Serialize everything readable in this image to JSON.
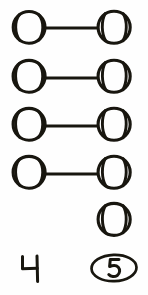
{
  "figure": {
    "title": "One-to-one matching of circles",
    "background_color": "#fefefe",
    "ink_color": "#18160f",
    "width": 148,
    "height": 295
  },
  "left_column": {
    "label": "left-group",
    "icon_name": "ball-circle",
    "count_value": "4",
    "count_circled": false,
    "items": [
      {
        "id": "L1",
        "cx": 29,
        "cy": 27,
        "r": 16
      },
      {
        "id": "L2",
        "cx": 29,
        "cy": 76,
        "r": 16
      },
      {
        "id": "L3",
        "cx": 29,
        "cy": 124,
        "r": 16
      },
      {
        "id": "L4",
        "cx": 29,
        "cy": 172,
        "r": 16
      }
    ]
  },
  "right_column": {
    "label": "right-group",
    "icon_name": "ball-circle",
    "count_value": "5",
    "count_circled": true,
    "items": [
      {
        "id": "R1",
        "cx": 114,
        "cy": 27,
        "r": 16
      },
      {
        "id": "R2",
        "cx": 114,
        "cy": 76,
        "r": 16
      },
      {
        "id": "R3",
        "cx": 114,
        "cy": 124,
        "r": 16
      },
      {
        "id": "R4",
        "cx": 114,
        "cy": 172,
        "r": 16
      },
      {
        "id": "R5",
        "cx": 114,
        "cy": 219,
        "r": 16
      }
    ]
  },
  "connectors": [
    {
      "id": "C1",
      "from": "L1",
      "to": "R1",
      "x1": 45,
      "x2": 98,
      "y": 28
    },
    {
      "id": "C2",
      "from": "L2",
      "to": "R2",
      "x1": 45,
      "x2": 98,
      "y": 78
    },
    {
      "id": "C3",
      "from": "L3",
      "to": "R3",
      "x1": 45,
      "x2": 98,
      "y": 126
    },
    {
      "id": "C4",
      "from": "L4",
      "to": "R4",
      "x1": 45,
      "x2": 98,
      "y": 174
    }
  ],
  "unmatched": {
    "id": "R5",
    "note": "fifth right circle has no connector"
  },
  "counts": {
    "left": {
      "text": "4",
      "x": 30,
      "y": 268
    },
    "right": {
      "text": "5",
      "x": 114,
      "y": 268,
      "enclosure": "ellipse"
    }
  }
}
